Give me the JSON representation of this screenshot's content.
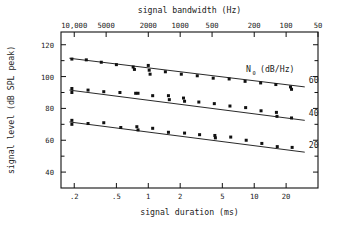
{
  "chart_data": {
    "type": "scatter",
    "title": "",
    "xlabel": "signal duration (ms)",
    "xlabel_top": "signal bandwidth (Hz)",
    "ylabel": "signal level (dB SPL peak)",
    "xscale": "log",
    "xlim": [
      0.15,
      40
    ],
    "ylim": [
      30,
      128
    ],
    "grid": false,
    "legend_title": "N",
    "legend_title_sub": "0",
    "legend_title_units": "(dB/Hz)",
    "legend_position": "right-inside",
    "xticks": [
      0.2,
      0.5,
      1,
      2,
      5,
      10,
      20
    ],
    "xticklabels": [
      ".2",
      ".5",
      "1",
      "2",
      "5",
      "10",
      "20"
    ],
    "xticks_top": [
      10000,
      5000,
      2000,
      1000,
      500,
      200,
      100,
      50
    ],
    "xticklabels_top": [
      "10,000",
      "5000",
      "2000",
      "1000",
      "500",
      "200",
      "100",
      "50"
    ],
    "yticks": [
      40,
      60,
      80,
      100,
      120
    ],
    "yticklabels": [
      "40",
      "60",
      "80",
      "100",
      "120"
    ],
    "yminorticks": [
      50,
      70,
      90,
      110
    ],
    "series": [
      {
        "name": "60",
        "label": "60",
        "fit": {
          "x0": 0.18,
          "y0": 111.5,
          "x1": 30.0,
          "y1": 93.5
        },
        "points": [
          [
            0.19,
            111.0
          ],
          [
            0.26,
            110.5
          ],
          [
            0.36,
            109.0
          ],
          [
            0.5,
            107.5
          ],
          [
            0.72,
            106.0
          ],
          [
            0.74,
            104.5
          ],
          [
            1.0,
            107.0
          ],
          [
            1.02,
            104.0
          ],
          [
            1.04,
            101.5
          ],
          [
            1.45,
            103.0
          ],
          [
            2.05,
            101.5
          ],
          [
            2.9,
            100.5
          ],
          [
            4.1,
            99.0
          ],
          [
            5.8,
            98.5
          ],
          [
            8.2,
            97.0
          ],
          [
            11.5,
            96.0
          ],
          [
            16.0,
            95.0
          ],
          [
            22.0,
            93.5
          ],
          [
            22.5,
            92.0
          ]
        ]
      },
      {
        "name": "40",
        "label": "40",
        "fit": {
          "x0": 0.18,
          "y0": 91.5,
          "x1": 30.0,
          "y1": 72.5
        },
        "points": [
          [
            0.19,
            92.5
          ],
          [
            0.19,
            90.0
          ],
          [
            0.27,
            91.5
          ],
          [
            0.38,
            90.5
          ],
          [
            0.54,
            90.0
          ],
          [
            0.76,
            89.5
          ],
          [
            0.8,
            89.5
          ],
          [
            1.1,
            88.0
          ],
          [
            1.55,
            88.0
          ],
          [
            1.58,
            85.5
          ],
          [
            2.15,
            86.5
          ],
          [
            2.2,
            84.5
          ],
          [
            3.0,
            84.0
          ],
          [
            4.2,
            83.0
          ],
          [
            5.9,
            81.5
          ],
          [
            8.3,
            80.5
          ],
          [
            11.6,
            78.5
          ],
          [
            16.2,
            77.5
          ],
          [
            16.4,
            75.0
          ],
          [
            22.5,
            74.0
          ]
        ]
      },
      {
        "name": "20",
        "label": "20",
        "fit": {
          "x0": 0.18,
          "y0": 71.5,
          "x1": 30.0,
          "y1": 52.5
        },
        "points": [
          [
            0.19,
            72.5
          ],
          [
            0.19,
            70.0
          ],
          [
            0.27,
            70.5
          ],
          [
            0.38,
            71.0
          ],
          [
            0.55,
            68.0
          ],
          [
            0.78,
            68.5
          ],
          [
            0.8,
            66.5
          ],
          [
            1.1,
            67.5
          ],
          [
            1.55,
            65.0
          ],
          [
            2.2,
            64.5
          ],
          [
            3.05,
            63.5
          ],
          [
            4.25,
            63.0
          ],
          [
            4.3,
            61.5
          ],
          [
            6.0,
            62.0
          ],
          [
            8.4,
            60.0
          ],
          [
            11.8,
            58.0
          ],
          [
            16.5,
            56.0
          ],
          [
            22.8,
            55.5
          ]
        ]
      }
    ]
  }
}
